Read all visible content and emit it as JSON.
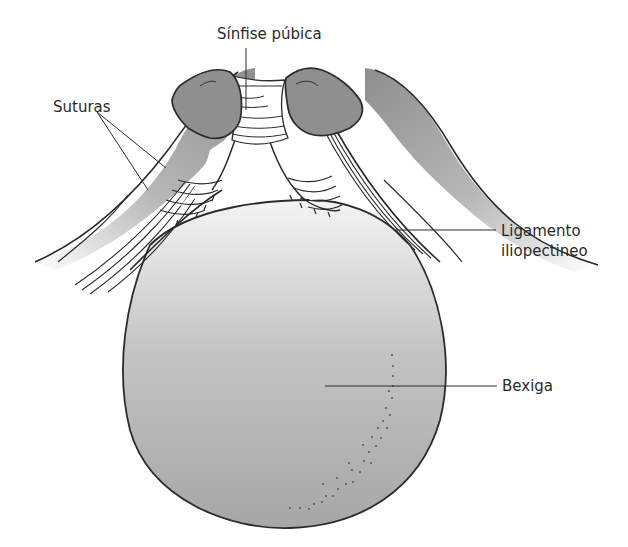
{
  "figure": {
    "type": "anatomical-diagram",
    "colors": {
      "outline": "#2b2b2b",
      "bone_fill": "#8f8f8f",
      "bladder_fill_top": "#f2f2f2",
      "bladder_fill_bottom": "#a9a9a9",
      "background": "#ffffff"
    }
  },
  "labels": {
    "symphysis": "Sínfise púbica",
    "sutures": "Suturas",
    "ligament_line1": "Ligamento",
    "ligament_line2": "iliopectineo",
    "bladder": "Bexiga"
  }
}
